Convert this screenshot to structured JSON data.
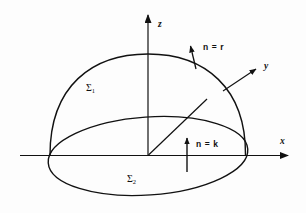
{
  "figure": {
    "background_color": "#fdfdfd",
    "stroke_color": "#111111",
    "width": 306,
    "height": 213
  },
  "axes": {
    "z": {
      "label": "z",
      "origin": [
        148,
        155
      ],
      "tip": [
        148,
        12
      ],
      "arrow": "up"
    },
    "x": {
      "label": "x",
      "start": [
        20,
        155
      ],
      "tip": [
        291,
        155
      ],
      "arrow": "right"
    },
    "y": {
      "label": "y",
      "origin": [
        148,
        155
      ],
      "tip": [
        259,
        67
      ],
      "arrow": "up-right"
    }
  },
  "surfaces": {
    "upper": {
      "label": "Σ",
      "subscript": "1",
      "description": "hemispherical cap"
    },
    "lower": {
      "label": "Σ",
      "subscript": "2",
      "description": "elliptical disk base"
    }
  },
  "normals": {
    "sphere": {
      "label": "n = r",
      "anchor": [
        196,
        68
      ],
      "tip": [
        190,
        44
      ]
    },
    "disk": {
      "label": "n = k",
      "anchor": [
        187,
        172
      ],
      "tip": [
        187,
        136
      ]
    }
  },
  "geometry": {
    "dome_left": [
      50,
      155
    ],
    "dome_right": [
      245,
      155
    ],
    "dome_apex": [
      148,
      54
    ],
    "ellipse_center": [
      148,
      156
    ],
    "ellipse_rx": 100,
    "ellipse_ry": 39,
    "ellipse_rotation_deg": -4
  }
}
